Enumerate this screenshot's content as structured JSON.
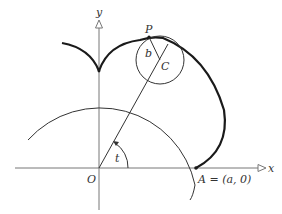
{
  "diagram": {
    "labels": {
      "y_axis": "y",
      "x_axis": "x",
      "origin": "O",
      "point_p": "P",
      "center_c": "C",
      "radius_b": "b",
      "angle_t": "t",
      "point_a": "A = (a, 0)"
    },
    "colors": {
      "curve": "#1a1a1a",
      "axis": "#777777",
      "circle": "#333333"
    },
    "geometry": {
      "origin": [
        99,
        168
      ],
      "fixed_circle_radius": 97,
      "rolling_circle_center": [
        160,
        60
      ],
      "rolling_circle_radius": 24,
      "point_p": [
        149,
        37
      ],
      "point_a": [
        196,
        168
      ]
    }
  }
}
